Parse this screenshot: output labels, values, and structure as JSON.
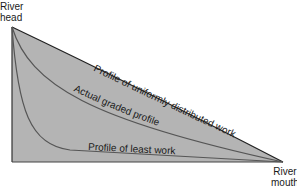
{
  "labels": {
    "head_line1": "River",
    "head_line2": "head",
    "mouth_line1": "River",
    "mouth_line2": "mouth"
  },
  "curves": {
    "uniform": "Profile of uniformly distributed work",
    "graded": "Actual graded profile",
    "least": "Profile of least work"
  },
  "colors": {
    "fill": "#b4b4b4",
    "line": "#333333",
    "curve": "#555555"
  }
}
